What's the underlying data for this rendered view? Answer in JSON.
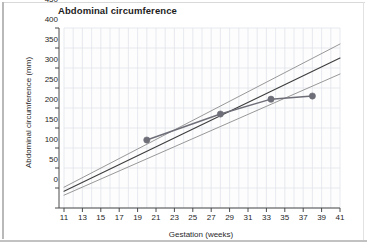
{
  "chart_data": {
    "type": "line",
    "title": "Abdominal circumference",
    "xlabel": "Gestation (weeks)",
    "ylabel": "Abdominal circumference (mm)",
    "xlim": [
      11,
      41
    ],
    "ylim": [
      0,
      450
    ],
    "xticks": [
      11,
      13,
      15,
      17,
      19,
      21,
      23,
      25,
      27,
      29,
      31,
      33,
      35,
      37,
      39,
      41
    ],
    "xtick_labels": [
      "11",
      "13",
      "15",
      "17",
      "19",
      "21",
      "23",
      "25",
      "27",
      "29",
      "31",
      "33",
      "35",
      "37",
      "39",
      "41"
    ],
    "yticks": [
      0,
      50,
      100,
      150,
      200,
      250,
      300,
      350,
      400,
      450
    ],
    "ytick_labels": [
      "0",
      "50",
      "100",
      "150",
      "200",
      "250",
      "300",
      "350",
      "400",
      "450"
    ],
    "grid": true,
    "grid_x_step": 1,
    "grid_y_step": 50,
    "legend": "none",
    "series": [
      {
        "name": "upper-reference-centile",
        "type": "line",
        "color": "#8c8c8c",
        "width": 0.9,
        "x": [
          11,
          41
        ],
        "values": [
          52,
          410
        ]
      },
      {
        "name": "median-reference-centile",
        "type": "line",
        "color": "#3d3d3d",
        "width": 1.1,
        "x": [
          11,
          41
        ],
        "values": [
          42,
          375
        ]
      },
      {
        "name": "lower-reference-centile",
        "type": "line",
        "color": "#8c8c8c",
        "width": 0.9,
        "x": [
          11,
          41
        ],
        "values": [
          32,
          335
        ]
      },
      {
        "name": "patient-measurements",
        "type": "line-with-markers",
        "color": "#6e6e78",
        "marker": "circle",
        "marker_size": 5,
        "width": 1.4,
        "x": [
          20,
          28,
          33.5,
          38
        ],
        "values": [
          170,
          235,
          272,
          280
        ]
      }
    ]
  }
}
